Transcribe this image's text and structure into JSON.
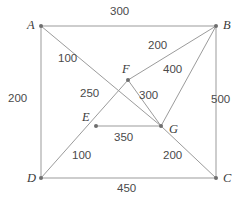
{
  "diagram": {
    "type": "weighted-graph",
    "title": "",
    "colors": {
      "edge": "#9b9b9b",
      "node": "#6e6e6e",
      "edge_label_text": "#4a4a4a",
      "node_label_text": "#3b3b3b",
      "background": "#ffffff"
    },
    "nodes": [
      {
        "id": "A",
        "label": "A",
        "x": 41,
        "y": 26,
        "label_x": 27,
        "label_y": 19
      },
      {
        "id": "B",
        "label": "B",
        "x": 216,
        "y": 26,
        "label_x": 223,
        "label_y": 19
      },
      {
        "id": "C",
        "label": "C",
        "x": 216,
        "y": 178,
        "label_x": 223,
        "label_y": 172
      },
      {
        "id": "D",
        "label": "D",
        "x": 41,
        "y": 178,
        "label_x": 27,
        "label_y": 172
      },
      {
        "id": "E",
        "label": "E",
        "x": 96,
        "y": 126,
        "label_x": 82,
        "label_y": 111
      },
      {
        "id": "F",
        "label": "F",
        "x": 128,
        "y": 80,
        "label_x": 122,
        "label_y": 63
      },
      {
        "id": "G",
        "label": "G",
        "x": 161,
        "y": 126,
        "label_x": 169,
        "label_y": 123
      }
    ],
    "edges": [
      {
        "from": "A",
        "to": "B",
        "weight": "300",
        "label_x": 110,
        "label_y": 6
      },
      {
        "from": "A",
        "to": "D",
        "weight": "200",
        "label_x": 8,
        "label_y": 93
      },
      {
        "from": "D",
        "to": "C",
        "weight": "450",
        "label_x": 117,
        "label_y": 183
      },
      {
        "from": "B",
        "to": "C",
        "weight": "500",
        "label_x": 211,
        "label_y": 94
      },
      {
        "from": "A",
        "to": "F",
        "weight": "100",
        "label_x": 58,
        "label_y": 53
      },
      {
        "from": "F",
        "to": "B",
        "weight": "200",
        "label_x": 148,
        "label_y": 40
      },
      {
        "from": "F",
        "to": "E",
        "weight": "250",
        "label_x": 80,
        "label_y": 88
      },
      {
        "from": "F",
        "to": "G",
        "weight": "300",
        "label_x": 139,
        "label_y": 90
      },
      {
        "from": "G",
        "to": "B",
        "weight": "400",
        "label_x": 163,
        "label_y": 64
      },
      {
        "from": "E",
        "to": "G",
        "weight": "350",
        "label_x": 114,
        "label_y": 132
      },
      {
        "from": "D",
        "to": "E",
        "weight": "100",
        "label_x": 72,
        "label_y": 150
      },
      {
        "from": "G",
        "to": "C",
        "weight": "200",
        "label_x": 163,
        "label_y": 150
      }
    ],
    "polylines": [
      {
        "name": "square-outline",
        "points": "41,26 216,26 216,178 41,178 41,26"
      },
      {
        "name": "diagonal-a-to-g",
        "points": "41,26 161,126"
      },
      {
        "name": "diagonal-d-to-f-b",
        "points": "41,178 128,80 216,26"
      },
      {
        "name": "segment-f-to-g",
        "points": "128,80 161,126"
      },
      {
        "name": "segment-g-to-b",
        "points": "161,126 216,26"
      },
      {
        "name": "segment-e-to-g",
        "points": "96,126 161,126"
      },
      {
        "name": "segment-g-to-c",
        "points": "161,126 216,178"
      }
    ]
  }
}
